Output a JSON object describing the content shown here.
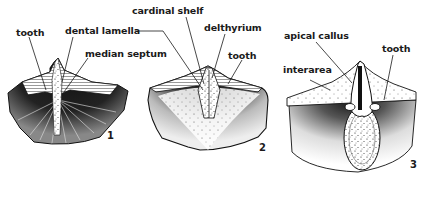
{
  "figure": {
    "colors": {
      "ink": "#1a1a1a",
      "paper": "#ffffff"
    }
  },
  "specimens": [
    {
      "number": "1",
      "labels": [
        "tooth",
        "dental lamella",
        "median septum"
      ]
    },
    {
      "number": "2",
      "labels": [
        "cardinal shelf",
        "delthyrium",
        "tooth"
      ]
    },
    {
      "number": "3",
      "labels": [
        "apical callus",
        "interarea",
        "tooth"
      ]
    }
  ]
}
